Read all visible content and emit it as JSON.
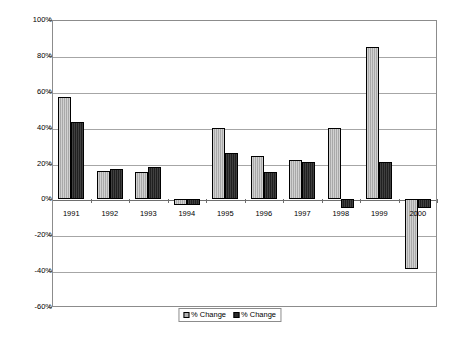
{
  "chart_data": {
    "type": "bar",
    "title": "",
    "subtitle": "",
    "xlabel": "",
    "ylabel": "",
    "categories": [
      "1991",
      "1992",
      "1993",
      "1994",
      "1995",
      "1996",
      "1997",
      "1998",
      "1999",
      "2000"
    ],
    "series": [
      {
        "name": "% Change",
        "color": "#b3b3b3",
        "values": [
          57,
          16,
          15,
          -3,
          40,
          24,
          22,
          40,
          85,
          -39
        ]
      },
      {
        "name": "% Change",
        "color": "#2b2b2b",
        "values": [
          43,
          17,
          18,
          -3,
          26,
          15,
          21,
          -5,
          21,
          -5
        ]
      }
    ],
    "ylim": [
      -60,
      100
    ],
    "ytick_values": [
      100,
      80,
      60,
      40,
      20,
      0,
      -20,
      -40,
      -60
    ],
    "ytick_labels": [
      "100%",
      "80%",
      "60%",
      "40%",
      "20%",
      "0%",
      "-20%",
      "-40%",
      "-60%"
    ],
    "grid": true,
    "grid_axis": "y",
    "legend_position": "bottom-center",
    "legend_entries": [
      "% Change",
      "% Change"
    ]
  }
}
